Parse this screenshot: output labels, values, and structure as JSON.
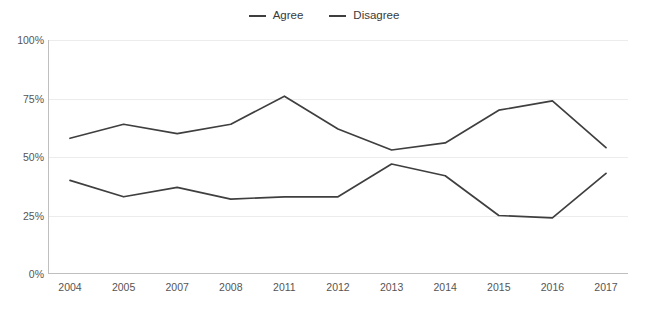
{
  "legend": {
    "position": "top-center",
    "entries": [
      {
        "label": "Agree",
        "color": "#3f3f3f",
        "marker": "line-marker-icon"
      },
      {
        "label": "Disagree",
        "color": "#3f3f3f",
        "marker": "line-marker-icon"
      }
    ]
  },
  "chart_data": {
    "type": "line",
    "title": "",
    "subtitle": "",
    "xlabel": "",
    "ylabel": "",
    "categories": [
      "2004",
      "2005",
      "2007",
      "2008",
      "2011",
      "2012",
      "2013",
      "2014",
      "2015",
      "2016",
      "2017"
    ],
    "ytick_labels": [
      "0%",
      "25%",
      "50%",
      "75%",
      "100%"
    ],
    "ytick_values": [
      0,
      25,
      50,
      75,
      100
    ],
    "ylim": [
      0,
      100
    ],
    "grid": true,
    "legend_position": "top-center",
    "series": [
      {
        "name": "Agree",
        "color": "#3f3f3f",
        "values": [
          58,
          64,
          60,
          64,
          76,
          62,
          53,
          56,
          70,
          74,
          54
        ]
      },
      {
        "name": "Disagree",
        "color": "#3f3f3f",
        "values": [
          40,
          33,
          37,
          32,
          33,
          33,
          47,
          42,
          25,
          24,
          43
        ]
      }
    ]
  }
}
